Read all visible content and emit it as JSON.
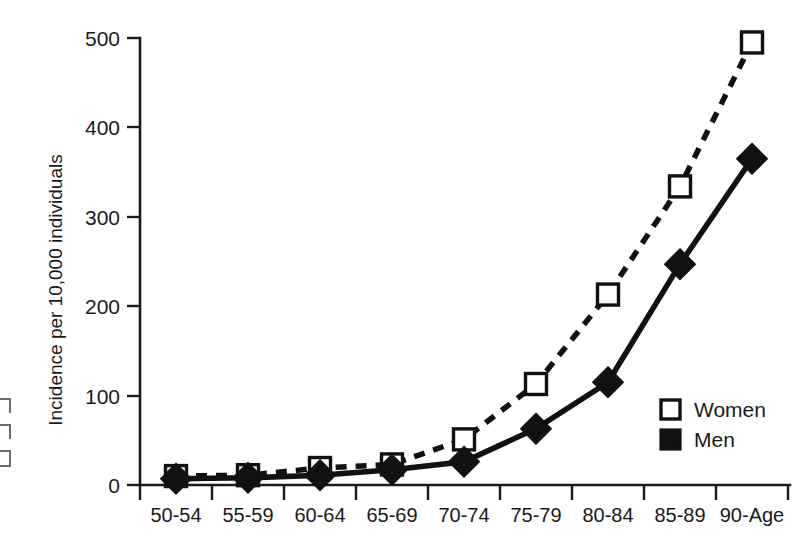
{
  "chart_data": {
    "type": "line",
    "title": "",
    "subtitle": "",
    "xlabel": "",
    "ylabel": "Incidence per 10,000 individuals",
    "categories": [
      "50-54",
      "55-59",
      "60-64",
      "65-69",
      "70-74",
      "75-79",
      "80-84",
      "85-89",
      "90-Age"
    ],
    "x_tick_labels": [
      "50-54",
      "55-59",
      "60-64",
      "65-69",
      "70-74",
      "75-79",
      "80-84",
      "85-89",
      "90-Age"
    ],
    "y_tick_labels": [
      "0",
      "100",
      "200",
      "300",
      "400",
      "500"
    ],
    "y_ticks": [
      0,
      100,
      200,
      300,
      400,
      500
    ],
    "ylim": [
      0,
      500
    ],
    "grid": false,
    "legend_position": "inside-right",
    "series": [
      {
        "name": "Women",
        "marker": "open-square",
        "line_style": "dashed",
        "color": "#111111",
        "values": [
          10,
          11,
          19,
          23,
          51,
          113,
          213,
          334,
          495
        ]
      },
      {
        "name": "Men",
        "marker": "filled-diamond",
        "line_style": "solid",
        "color": "#111111",
        "values": [
          7,
          8,
          11,
          17,
          26,
          63,
          115,
          247,
          365
        ]
      }
    ],
    "legend": [
      {
        "label": "Women",
        "marker": "open-square"
      },
      {
        "label": "Men",
        "marker": "filled-square"
      }
    ]
  },
  "axes": {
    "y_axis_name": "incidence-axis",
    "x_axis_name": "age-group-axis"
  }
}
